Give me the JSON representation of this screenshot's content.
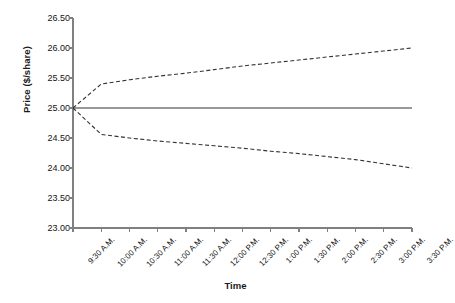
{
  "chart_data": {
    "type": "line",
    "title": "",
    "xlabel": "Time",
    "ylabel": "Price ($/share)",
    "ylim": [
      23.0,
      26.5
    ],
    "ytick_labels": [
      "26.50",
      "26.00",
      "25.50",
      "25.00",
      "24.50",
      "24.00",
      "23.50",
      "23.00"
    ],
    "ytick_values": [
      26.5,
      26.0,
      25.5,
      25.0,
      24.5,
      24.0,
      23.5,
      23.0
    ],
    "grid": false,
    "legend": "none",
    "categories": [
      "9:30 A.M.",
      "10:00 A.M.",
      "10:30 A.M.",
      "11:00 A.M.",
      "11:30 A.M.",
      "12:00 P.M.",
      "12:30 P.M.",
      "1:00 P.M.",
      "1:30 P.M.",
      "2:00 P.M.",
      "2:30 P.M.",
      "3:00 P.M.",
      "3:30 P.M."
    ],
    "series": [
      {
        "name": "Upper bound",
        "style": "dashed",
        "color": "#333333",
        "values": [
          25.0,
          25.4,
          25.47,
          25.53,
          25.58,
          25.64,
          25.7,
          25.75,
          25.8,
          25.85,
          25.9,
          25.95,
          26.0
        ]
      },
      {
        "name": "Reference price",
        "style": "solid",
        "color": "#333333",
        "values": [
          25.0,
          25.0,
          25.0,
          25.0,
          25.0,
          25.0,
          25.0,
          25.0,
          25.0,
          25.0,
          25.0,
          25.0,
          25.0
        ]
      },
      {
        "name": "Lower bound",
        "style": "dashed",
        "color": "#333333",
        "values": [
          25.0,
          24.56,
          24.5,
          24.45,
          24.41,
          24.37,
          24.33,
          24.28,
          24.24,
          24.19,
          24.14,
          24.07,
          24.0
        ]
      }
    ]
  },
  "axis_colors": {
    "axis_line": "#808080",
    "tick": "#808080",
    "data_line": "#333333"
  }
}
